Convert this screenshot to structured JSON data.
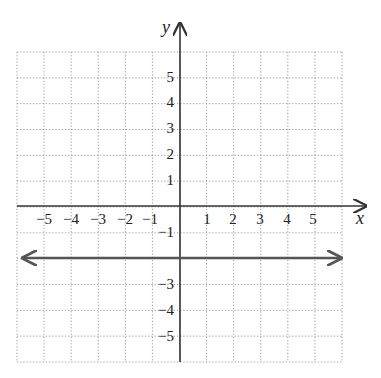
{
  "chart_data": {
    "type": "line",
    "title": "",
    "xlabel": "x",
    "ylabel": "y",
    "xlim": [
      -6,
      6
    ],
    "ylim": [
      -6,
      6
    ],
    "grid": true,
    "grid_style": "dotted",
    "x_ticks": [
      "-5",
      "-4",
      "-3",
      "-2",
      "-1",
      "1",
      "2",
      "3",
      "4",
      "5"
    ],
    "y_ticks": [
      "5",
      "4",
      "3",
      "2",
      "1",
      "-1",
      "-3",
      "-4",
      "-5"
    ],
    "series": [
      {
        "name": "y = -2",
        "equation": "y = -2",
        "x": [
          -6,
          6
        ],
        "y": [
          -2,
          -2
        ],
        "arrows": "both"
      }
    ],
    "legend": "none"
  },
  "colors": {
    "axis": "#333333",
    "line": "#555555",
    "grid": "#999999",
    "text": "#222222"
  },
  "labels": {
    "x_axis": "x",
    "y_axis": "y",
    "x_neg": [
      "−5",
      "−4",
      "−3",
      "−2",
      "−1"
    ],
    "x_pos": [
      "1",
      "2",
      "3",
      "4",
      "5"
    ],
    "y_pos": [
      "5",
      "4",
      "3",
      "2",
      "1"
    ],
    "y_neg": [
      "−1",
      "−3",
      "−4",
      "−5"
    ]
  }
}
